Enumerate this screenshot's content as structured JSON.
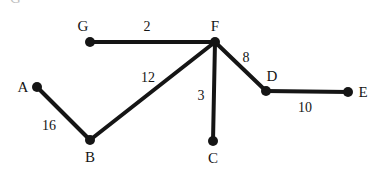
{
  "figure": {
    "width": 374,
    "height": 173,
    "background_color": "#ffffff",
    "ink_color": "#151515",
    "partial_top_glyph": "G"
  },
  "chart_data": {
    "type": "diagram",
    "diagram_kind": "weighted-undirected-graph",
    "title": "",
    "xlabel": "",
    "ylabel": "",
    "grid": false,
    "legend": false,
    "nodes": [
      {
        "id": "A",
        "label": "A",
        "x": 37,
        "y": 87,
        "label_x": 23,
        "label_y": 87
      },
      {
        "id": "B",
        "label": "B",
        "x": 90,
        "y": 140,
        "label_x": 90,
        "label_y": 157
      },
      {
        "id": "C",
        "label": "C",
        "x": 213,
        "y": 141,
        "label_x": 213,
        "label_y": 158
      },
      {
        "id": "D",
        "label": "D",
        "x": 266,
        "y": 91,
        "label_x": 272,
        "label_y": 76
      },
      {
        "id": "E",
        "label": "E",
        "x": 348,
        "y": 92,
        "label_x": 363,
        "label_y": 92
      },
      {
        "id": "F",
        "label": "F",
        "x": 215,
        "y": 42,
        "label_x": 215,
        "label_y": 26
      },
      {
        "id": "G",
        "label": "G",
        "x": 90,
        "y": 42,
        "label_x": 83,
        "label_y": 26
      }
    ],
    "edges": [
      {
        "source": "G",
        "target": "F",
        "weight": 2,
        "label": "2",
        "label_x": 147,
        "label_y": 27
      },
      {
        "source": "F",
        "target": "D",
        "weight": 8,
        "label": "8",
        "label_x": 246,
        "label_y": 58
      },
      {
        "source": "D",
        "target": "E",
        "weight": 10,
        "label": "10",
        "label_x": 305,
        "label_y": 108
      },
      {
        "source": "F",
        "target": "C",
        "weight": 3,
        "label": "3",
        "label_x": 201,
        "label_y": 96
      },
      {
        "source": "F",
        "target": "B",
        "weight": 12,
        "label": "12",
        "label_x": 148,
        "label_y": 78
      },
      {
        "source": "B",
        "target": "A",
        "weight": 16,
        "label": "16",
        "label_x": 49,
        "label_y": 126
      }
    ],
    "node_radius": 5,
    "edge_width": 4
  }
}
